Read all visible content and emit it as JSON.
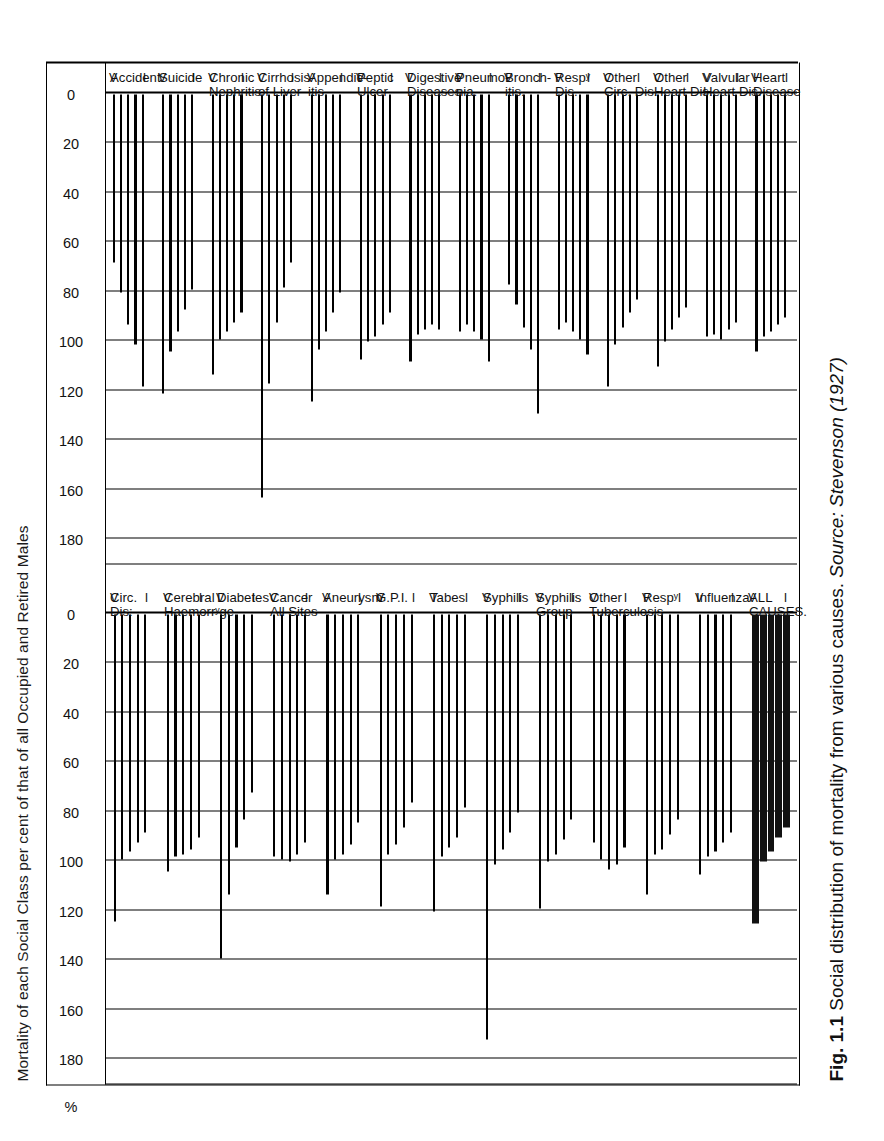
{
  "figure": {
    "title": "Mortality of each Social Class per cent of that of all Occupied and Retired Males",
    "caption_label": "Fig. 1.1",
    "caption_text": "Social distribution of mortality from various causes.",
    "caption_source": "Source: Stevenson (1927)",
    "percent_symbol": "%",
    "class_markers": [
      "I",
      "V"
    ]
  },
  "axis": {
    "ticks": [
      180,
      160,
      140,
      120,
      100,
      80,
      60,
      40,
      20,
      0
    ],
    "tick_labels": [
      "180",
      "160",
      "140",
      "120",
      "100",
      "80",
      "60",
      "40",
      "20",
      "0"
    ],
    "min": 0,
    "max": 190,
    "unit": "%",
    "direction": "descending-left-to-right"
  },
  "chart_data": {
    "type": "bar",
    "title": "Mortality of each Social Class per cent of that of all Occupied and Retired Males",
    "xlabel": "",
    "ylabel": "%",
    "ylim": [
      0,
      190
    ],
    "grid": true,
    "legend_position": "none",
    "series": [
      {
        "name": "I"
      },
      {
        "name": "II"
      },
      {
        "name": "III"
      },
      {
        "name": "IV"
      },
      {
        "name": "V"
      }
    ],
    "panels": [
      {
        "name": "upper",
        "groups": [
          {
            "label_line1": "ALL",
            "label_line2": "CAUSES.",
            "solid": true,
            "values": [
              125,
              100,
              96,
              90,
              86
            ]
          },
          {
            "label_line1": "Influenza",
            "label_line2": "",
            "values": [
              105,
              98,
              96,
              92,
              88
            ]
          },
          {
            "label_line1": "Respʸ",
            "label_line2": "",
            "brace": true,
            "values": [
              113,
              97,
              95,
              89,
              83
            ]
          },
          {
            "label_line1": "Other",
            "label_line2": "Tuberculosis",
            "values": [
              92,
              99,
              103,
              101,
              94
            ]
          },
          {
            "label_line1": "Syphilis",
            "label_line2": "Group",
            "values": [
              119,
              100,
              97,
              91,
              83
            ]
          },
          {
            "label_line1": "Syphilis",
            "label_line2": "",
            "values": [
              172,
              101,
              95,
              88,
              80
            ]
          },
          {
            "label_line1": "Tabes",
            "label_line2": "",
            "values": [
              120,
              98,
              94,
              90,
              78
            ]
          },
          {
            "label_line1": "G.P.I.",
            "label_line2": "",
            "values": [
              118,
              97,
              93,
              86,
              76
            ]
          },
          {
            "label_line1": "Aneurysm",
            "label_line2": "",
            "values": [
              113,
              99,
              97,
              93,
              84
            ]
          },
          {
            "label_line1": "Cancer",
            "label_line2": "All Sites",
            "values": [
              98,
              99,
              100,
              97,
              92
            ]
          },
          {
            "label_line1": "Diabetes",
            "label_line2": "",
            "values": [
              139,
              113,
              94,
              83,
              72
            ]
          },
          {
            "label_line1": "Cerebral",
            "label_line2": "Haemorrʸge",
            "values": [
              104,
              98,
              97,
              95,
              90
            ]
          },
          {
            "label_line1": "Circ.",
            "label_line2": "Dis:",
            "values": [
              124,
              99,
              96,
              92,
              88
            ]
          }
        ]
      },
      {
        "name": "lower",
        "groups": [
          {
            "label_line1": "Heart",
            "label_line2": "Disease",
            "values": [
              104,
              98,
              96,
              93,
              90
            ]
          },
          {
            "label_line1": "Valvular",
            "label_line2": "Heart Dis.",
            "values": [
              98,
              97,
              99,
              95,
              92
            ]
          },
          {
            "label_line1": "Other",
            "label_line2": "Heart Dis.",
            "values": [
              110,
              100,
              95,
              90,
              86
            ]
          },
          {
            "label_line1": "Other",
            "label_line2": "Circ. Dis.",
            "values": [
              118,
              101,
              94,
              88,
              83
            ]
          },
          {
            "label_line1": "Respʸ",
            "label_line2": "Dis.",
            "values": [
              95,
              92,
              96,
              99,
              105
            ]
          },
          {
            "label_line1": "Bronch-",
            "label_line2": "itis.",
            "values": [
              77,
              85,
              94,
              103,
              129
            ]
          },
          {
            "label_line1": "Pneumo-",
            "label_line2": "nia.",
            "values": [
              96,
              93,
              96,
              99,
              108
            ]
          },
          {
            "label_line1": "Digestive",
            "label_line2": "Diseases",
            "values": [
              108,
              97,
              95,
              93,
              95
            ]
          },
          {
            "label_line1": "Peptic",
            "label_line2": "Ulcer",
            "values": [
              107,
              100,
              98,
              93,
              88
            ]
          },
          {
            "label_line1": "Appendic-",
            "label_line2": "itis.",
            "values": [
              124,
              103,
              96,
              88,
              80
            ]
          },
          {
            "label_line1": "Cirrhosis",
            "label_line2": "of Liver",
            "values": [
              163,
              117,
              92,
              78,
              68
            ]
          },
          {
            "label_line1": "Chronic",
            "label_line2": "Nephritis",
            "values": [
              113,
              99,
              96,
              92,
              88
            ]
          },
          {
            "label_line1": "Suicide",
            "label_line2": "",
            "values": [
              121,
              104,
              96,
              87,
              79
            ]
          },
          {
            "label_line1": "Accident",
            "label_line2": "",
            "values": [
              68,
              80,
              93,
              101,
              118
            ]
          }
        ]
      }
    ]
  }
}
